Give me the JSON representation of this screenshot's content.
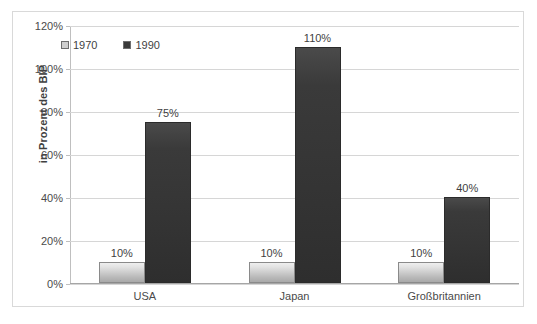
{
  "chart_data": {
    "type": "bar",
    "title": "",
    "subtitle": "",
    "xlabel": "",
    "ylabel": "in Prozent des BIP",
    "categories": [
      "USA",
      "Japan",
      "Großbritannien"
    ],
    "series": [
      {
        "name": "1970",
        "values": [
          10,
          10,
          10
        ],
        "color": "#cfcfcf"
      },
      {
        "name": "1990",
        "values": [
          75,
          110,
          40
        ],
        "color": "#3a3a3a"
      }
    ],
    "value_suffix": "%",
    "data_labels": [
      [
        "10%",
        "10%",
        "10%"
      ],
      [
        "75%",
        "110%",
        "40%"
      ]
    ],
    "ylim": [
      0,
      120
    ],
    "ytick_step": 20,
    "ytick_labels": [
      "120%",
      "100%",
      "80%",
      "60%",
      "40%",
      "20%",
      "0%"
    ],
    "ytick_values": [
      120,
      100,
      80,
      60,
      40,
      20,
      0
    ],
    "grid": true,
    "legend_position": "top-left-inside",
    "legend_entries": [
      "1970",
      "1990"
    ],
    "border": true
  }
}
